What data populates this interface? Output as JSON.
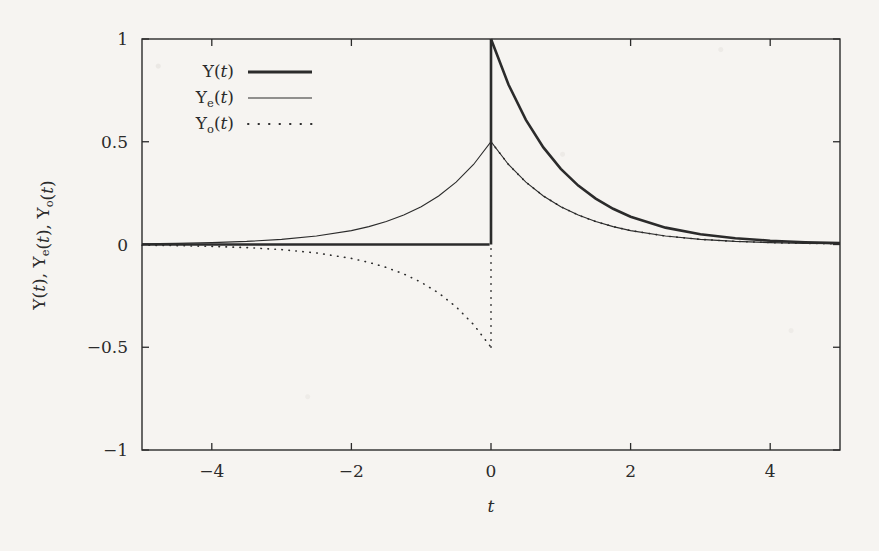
{
  "figure": {
    "background_color": "#f6f4f1",
    "ink_color": "#2b2b2b"
  },
  "chart_data": {
    "type": "line",
    "title": "",
    "xlabel": "t",
    "ylabel": "Υ(t), Υₑ(t), Υₒ(t)",
    "xlim": [
      -5,
      5
    ],
    "ylim": [
      -1,
      1
    ],
    "xticks": [
      -4,
      -2,
      0,
      2,
      4
    ],
    "xtick_labels": [
      "−4",
      "−2",
      "0",
      "2",
      "4"
    ],
    "yticks": [
      -1,
      -0.5,
      0,
      0.5,
      1
    ],
    "ytick_labels": [
      "−1",
      "−0.5",
      "0",
      "0.5",
      "1"
    ],
    "grid": false,
    "legend_position": "upper left inside",
    "ticks_direction": "in",
    "frame": "box (all four spines)",
    "series": [
      {
        "name": "Υ(t)",
        "label_base": "Υ",
        "label_sub": "",
        "style": "solid-thick",
        "linewidth": 2.6,
        "color": "#2b2b2b",
        "formula": "exp(-t) * u(t)",
        "description": "Causal decaying exponential: 0 for t<0, jumps to 1 at t=0, then e^{-t}",
        "points": [
          [
            -5,
            0
          ],
          [
            -4,
            0
          ],
          [
            -3,
            0
          ],
          [
            -2,
            0
          ],
          [
            -1,
            0
          ],
          [
            -0.25,
            0
          ],
          [
            -0.02,
            0
          ],
          [
            0,
            1
          ],
          [
            0.25,
            0.7788
          ],
          [
            0.5,
            0.6065
          ],
          [
            0.75,
            0.4724
          ],
          [
            1,
            0.3679
          ],
          [
            1.25,
            0.2865
          ],
          [
            1.5,
            0.2231
          ],
          [
            1.75,
            0.1738
          ],
          [
            2,
            0.1353
          ],
          [
            2.5,
            0.0821
          ],
          [
            3,
            0.0498
          ],
          [
            3.5,
            0.0302
          ],
          [
            4,
            0.0183
          ],
          [
            4.5,
            0.0111
          ],
          [
            5,
            0.0067
          ]
        ]
      },
      {
        "name": "Υₑ(t)",
        "label_base": "Υ",
        "label_sub": "e",
        "style": "solid-thin",
        "linewidth": 1.1,
        "color": "#2b2b2b",
        "formula": "0.5 * exp(-|t|)",
        "description": "Even part: symmetric two-sided decaying exponential peaking at 0.5 for t=0",
        "points": [
          [
            -5,
            0.0034
          ],
          [
            -4.5,
            0.0056
          ],
          [
            -4,
            0.0092
          ],
          [
            -3.5,
            0.0151
          ],
          [
            -3,
            0.0249
          ],
          [
            -2.5,
            0.041
          ],
          [
            -2,
            0.0677
          ],
          [
            -1.75,
            0.0869
          ],
          [
            -1.5,
            0.1116
          ],
          [
            -1.25,
            0.1432
          ],
          [
            -1,
            0.1839
          ],
          [
            -0.75,
            0.2362
          ],
          [
            -0.5,
            0.3033
          ],
          [
            -0.25,
            0.3894
          ],
          [
            0,
            0.5
          ],
          [
            0.25,
            0.3894
          ],
          [
            0.5,
            0.3033
          ],
          [
            0.75,
            0.2362
          ],
          [
            1,
            0.1839
          ],
          [
            1.25,
            0.1432
          ],
          [
            1.5,
            0.1116
          ],
          [
            1.75,
            0.0869
          ],
          [
            2,
            0.0677
          ],
          [
            2.5,
            0.041
          ],
          [
            3,
            0.0249
          ],
          [
            3.5,
            0.0151
          ],
          [
            4,
            0.0092
          ],
          [
            4.5,
            0.0056
          ],
          [
            5,
            0.0034
          ]
        ]
      },
      {
        "name": "Υₒ(t)",
        "label_base": "Υ",
        "label_sub": "o",
        "style": "dotted",
        "linewidth": 1.6,
        "color": "#2b2b2b",
        "formula": "0.5 * sgn(t) * exp(-|t|)",
        "description": "Odd part: negative mirror for t<0 reaching -0.5 at t=0-, vertical jump to +0.5 at t=0+",
        "points": [
          [
            -5,
            -0.0034
          ],
          [
            -4.5,
            -0.0056
          ],
          [
            -4,
            -0.0092
          ],
          [
            -3.5,
            -0.0151
          ],
          [
            -3,
            -0.0249
          ],
          [
            -2.5,
            -0.041
          ],
          [
            -2,
            -0.0677
          ],
          [
            -1.75,
            -0.0869
          ],
          [
            -1.5,
            -0.1116
          ],
          [
            -1.25,
            -0.1432
          ],
          [
            -1,
            -0.1839
          ],
          [
            -0.75,
            -0.2362
          ],
          [
            -0.5,
            -0.3033
          ],
          [
            -0.25,
            -0.3894
          ],
          [
            0,
            -0.5
          ],
          [
            0,
            0.5
          ],
          [
            0.25,
            0.3894
          ],
          [
            0.5,
            0.3033
          ],
          [
            0.75,
            0.2362
          ],
          [
            1,
            0.1839
          ],
          [
            1.25,
            0.1432
          ],
          [
            1.5,
            0.1116
          ],
          [
            1.75,
            0.0869
          ],
          [
            2,
            0.0677
          ],
          [
            2.5,
            0.041
          ],
          [
            3,
            0.0249
          ],
          [
            3.5,
            0.0151
          ],
          [
            4,
            0.0092
          ],
          [
            4.5,
            0.0056
          ],
          [
            5,
            0.0034
          ]
        ]
      }
    ],
    "annotations": [
      "Discontinuity at t = 0 for Υ(t) (0 → 1) and Υₒ(t) (−0.5 → +0.5)",
      "Υₑ(t) and Υₒ(t) coincide for t > 0"
    ]
  },
  "legend": {
    "entries": [
      {
        "label_base": "Υ",
        "label_sub": "",
        "label_tail": "(t)",
        "sample": "solid-thick"
      },
      {
        "label_base": "Υ",
        "label_sub": "e",
        "label_tail": "(t)",
        "sample": "solid-thin"
      },
      {
        "label_base": "Υ",
        "label_sub": "o",
        "label_tail": "(t)",
        "sample": "dotted"
      }
    ]
  },
  "axis_titles": {
    "x": "t",
    "y_parts": [
      {
        "base": "Υ",
        "sub": "",
        "tail": "(t),"
      },
      {
        "base": "Υ",
        "sub": "e",
        "tail": "(t),"
      },
      {
        "base": "Υ",
        "sub": "o",
        "tail": "(t)"
      }
    ]
  }
}
